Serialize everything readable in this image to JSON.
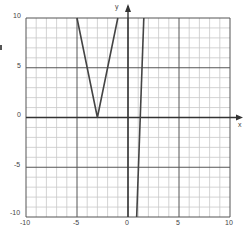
{
  "chart_data": {
    "type": "line",
    "title": "",
    "xlabel": "x",
    "ylabel": "y",
    "xlim": [
      -10,
      10
    ],
    "ylim": [
      -10,
      10
    ],
    "grid": true,
    "grid_minor_step": 1,
    "grid_major_step": 5,
    "x_ticks": [
      -10,
      -5,
      0,
      5,
      10
    ],
    "y_ticks": [
      -10,
      -5,
      0,
      5,
      10
    ],
    "x_tick_labels": [
      "-10",
      "-5",
      "0",
      "5",
      "10"
    ],
    "y_tick_labels": [
      "-10",
      "-5",
      "0",
      "5",
      "10"
    ],
    "legend": [],
    "series": [
      {
        "name": "V-shaped absolute value graph",
        "points": [
          [
            -5,
            10
          ],
          [
            -3,
            0
          ],
          [
            -1,
            10
          ]
        ]
      },
      {
        "name": "steep line",
        "points": [
          [
            0.85,
            -10
          ],
          [
            1.55,
            10
          ]
        ]
      }
    ]
  },
  "colors": {
    "minor_grid": "#c8c8c8",
    "major_grid": "#555555",
    "axis": "#333333",
    "curve": "#444444",
    "label": "#444444"
  }
}
